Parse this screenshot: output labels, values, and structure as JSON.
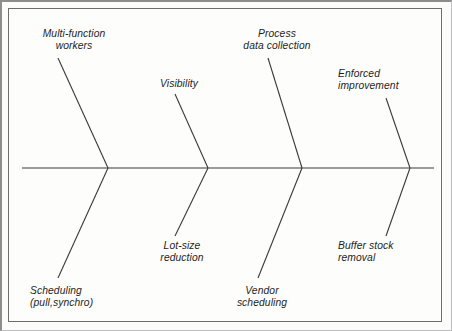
{
  "diagram": {
    "type": "fishbone",
    "title": "",
    "background_color": "#fdfdfb",
    "line_color": "#3a3a3a",
    "spine": {
      "label": "spine",
      "x_start": 22,
      "x_end": 434,
      "y": 168
    },
    "junctions": [
      108,
      208,
      302,
      410
    ],
    "bones": [
      {
        "id": "multi-function-workers",
        "label_line1": "Multi-function",
        "label_line2": "workers",
        "position": "upper",
        "label_x": 28,
        "label_y": 28,
        "label_width": 92,
        "line": {
          "x1": 58,
          "y1": 58,
          "x2": 108,
          "y2": 168
        }
      },
      {
        "id": "visibility",
        "label_line1": "Visibility",
        "label_line2": "",
        "position": "upper",
        "label_x": 148,
        "label_y": 78,
        "label_width": 62,
        "line": {
          "x1": 175,
          "y1": 94,
          "x2": 208,
          "y2": 168
        }
      },
      {
        "id": "process-data-collection",
        "label_line1": "Process",
        "label_line2": "data collection",
        "position": "upper",
        "label_x": 231,
        "label_y": 28,
        "label_width": 92,
        "line": {
          "x1": 268,
          "y1": 58,
          "x2": 302,
          "y2": 168
        }
      },
      {
        "id": "enforced-improvement",
        "label_line1": "Enforced",
        "label_line2": "improvement",
        "position": "upper",
        "label_x": 338,
        "label_y": 68,
        "label_width": 90,
        "line": {
          "x1": 386,
          "y1": 98,
          "x2": 410,
          "y2": 168
        }
      },
      {
        "id": "scheduling-pull-synchro",
        "label_line1": "Scheduling",
        "label_line2": "(pull,synchro)",
        "position": "lower",
        "label_x": 30,
        "label_y": 285,
        "label_width": 96,
        "line": {
          "x1": 108,
          "y1": 168,
          "x2": 58,
          "y2": 278
        }
      },
      {
        "id": "lot-size-reduction",
        "label_line1": "Lot-size",
        "label_line2": "reduction",
        "position": "lower",
        "label_x": 146,
        "label_y": 240,
        "label_width": 72,
        "line": {
          "x1": 208,
          "y1": 168,
          "x2": 175,
          "y2": 236
        }
      },
      {
        "id": "vendor-scheduling",
        "label_line1": "Vendor",
        "label_line2": "scheduling",
        "position": "lower",
        "label_x": 219,
        "label_y": 285,
        "label_width": 86,
        "line": {
          "x1": 302,
          "y1": 168,
          "x2": 258,
          "y2": 278
        }
      },
      {
        "id": "buffer-stock-removal",
        "label_line1": "Buffer stock",
        "label_line2": "removal",
        "position": "lower",
        "label_x": 338,
        "label_y": 240,
        "label_width": 88,
        "line": {
          "x1": 410,
          "y1": 168,
          "x2": 386,
          "y2": 236
        }
      }
    ]
  }
}
